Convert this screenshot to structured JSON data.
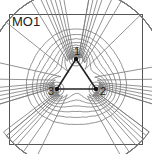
{
  "panel": {
    "title": "MO1",
    "frame": {
      "x": 9,
      "y": 14,
      "w": 134,
      "h": 131
    },
    "atoms": [
      {
        "label": "1",
        "x": 76,
        "y": 59,
        "lx": 74,
        "ly": 55
      },
      {
        "label": "2",
        "x": 96,
        "y": 89,
        "lx": 100,
        "ly": 95
      },
      {
        "label": "3",
        "x": 57,
        "y": 89,
        "lx": 48,
        "ly": 95
      }
    ],
    "bonds": [
      [
        0,
        1
      ],
      [
        1,
        2
      ],
      [
        2,
        0
      ]
    ],
    "contour_levels": [
      0.9,
      1.05,
      1.2,
      1.38,
      1.58,
      1.8,
      2.05,
      2.35,
      2.7,
      3.1,
      3.6,
      4.2,
      5.0,
      6.0
    ],
    "colors": {
      "contour": "#777777",
      "bond": "#222222",
      "atom": "#111111",
      "frame": "#555555"
    }
  }
}
